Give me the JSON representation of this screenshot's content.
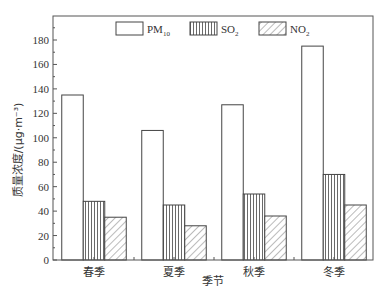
{
  "chart_data": {
    "type": "bar",
    "title": "",
    "xlabel": "季节",
    "ylabel": "质量浓度/(μg·m⁻³)",
    "categories": [
      "春季",
      "夏季",
      "秋季",
      "冬季"
    ],
    "series": [
      {
        "name": "PM10",
        "label_main": "PM",
        "label_sub": "10",
        "pattern": "empty",
        "values": [
          135,
          106,
          127,
          175
        ]
      },
      {
        "name": "SO2",
        "label_main": "SO",
        "label_sub": "2",
        "pattern": "vertical-lines",
        "values": [
          48,
          45,
          54,
          70
        ]
      },
      {
        "name": "NO2",
        "label_main": "NO",
        "label_sub": "2",
        "pattern": "diagonal-hatch",
        "values": [
          35,
          28,
          36,
          45
        ]
      }
    ],
    "ylim": [
      0,
      200
    ],
    "yticks": [
      0,
      20,
      40,
      60,
      80,
      100,
      120,
      140,
      160,
      180
    ],
    "grid": false,
    "legend_position": "top-inside"
  }
}
